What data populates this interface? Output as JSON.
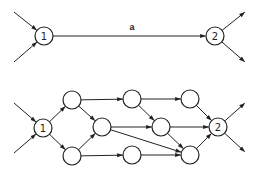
{
  "colors": {
    "stroke": "#222222",
    "background": "#ffffff"
  },
  "top_diagram": {
    "nodes": [
      {
        "id": "t1",
        "label": "1",
        "x": 44,
        "y": 36
      },
      {
        "id": "t2",
        "label": "2",
        "x": 215,
        "y": 36
      }
    ],
    "edges": [
      {
        "from": [
          14,
          12
        ],
        "to": "t1"
      },
      {
        "from": [
          14,
          62
        ],
        "to": "t1"
      },
      {
        "from": "t1",
        "to": "t2",
        "label": "a"
      },
      {
        "from": "t2",
        "to": [
          245,
          12
        ]
      },
      {
        "from": "t2",
        "to": [
          245,
          62
        ]
      }
    ],
    "edge_label": {
      "text": "a",
      "x": 132,
      "y": 30
    }
  },
  "bottom_diagram": {
    "nodes": [
      {
        "id": "b1",
        "label": "1",
        "x": 43,
        "y": 128
      },
      {
        "id": "n1",
        "label": "",
        "x": 72,
        "y": 100
      },
      {
        "id": "n2",
        "label": "",
        "x": 72,
        "y": 156
      },
      {
        "id": "n3",
        "label": "",
        "x": 102,
        "y": 127
      },
      {
        "id": "n4",
        "label": "",
        "x": 132,
        "y": 99
      },
      {
        "id": "n5",
        "label": "",
        "x": 132,
        "y": 155
      },
      {
        "id": "n6",
        "label": "",
        "x": 161,
        "y": 127
      },
      {
        "id": "n7",
        "label": "",
        "x": 190,
        "y": 99
      },
      {
        "id": "n8",
        "label": "",
        "x": 190,
        "y": 155
      },
      {
        "id": "b2",
        "label": "2",
        "x": 218,
        "y": 127
      }
    ],
    "edges": [
      {
        "from": [
          14,
          103
        ],
        "to": "b1"
      },
      {
        "from": [
          14,
          153
        ],
        "to": "b1"
      },
      {
        "from": "b1",
        "to": "n1"
      },
      {
        "from": "b1",
        "to": "n2"
      },
      {
        "from": "n1",
        "to": "n3"
      },
      {
        "from": "n2",
        "to": "n3"
      },
      {
        "from": "n1",
        "to": "n4"
      },
      {
        "from": "n2",
        "to": "n5"
      },
      {
        "from": "n3",
        "to": "n6"
      },
      {
        "from": "n3",
        "to": "n8"
      },
      {
        "from": "n4",
        "to": "n6"
      },
      {
        "from": "n4",
        "to": "n7"
      },
      {
        "from": "n5",
        "to": "n8"
      },
      {
        "from": "n6",
        "to": "b2"
      },
      {
        "from": "n6",
        "to": "n8"
      },
      {
        "from": "n7",
        "to": "b2"
      },
      {
        "from": "n8",
        "to": "b2"
      },
      {
        "from": "b2",
        "to": [
          245,
          103
        ]
      },
      {
        "from": "b2",
        "to": [
          245,
          152
        ]
      }
    ]
  },
  "node_radius": 9
}
